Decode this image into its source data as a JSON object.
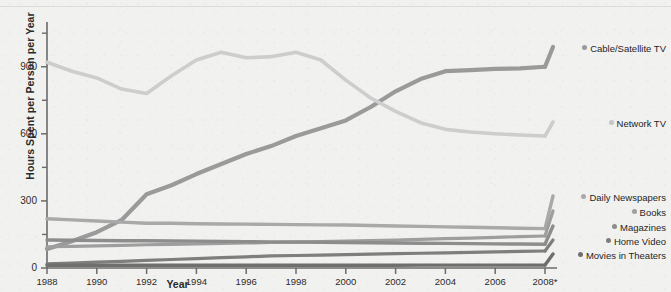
{
  "chart_data": {
    "type": "line",
    "title": "",
    "xlabel": "Year",
    "ylabel": "Hours Spent per Person per Year",
    "x": [
      1988,
      1989,
      1990,
      1991,
      1992,
      1993,
      1994,
      1995,
      1996,
      1997,
      1998,
      1999,
      2000,
      2001,
      2002,
      2003,
      2004,
      2005,
      2006,
      2007,
      2008
    ],
    "xtick_labels": [
      "1988",
      "1990",
      "1992",
      "1994",
      "1996",
      "1998",
      "2000",
      "2002",
      "2004",
      "2006",
      "2008*"
    ],
    "xtick_values": [
      1988,
      1990,
      1992,
      1994,
      1996,
      1998,
      2000,
      2002,
      2004,
      2006,
      2008
    ],
    "ytick_labels": [
      "0",
      "300",
      "600",
      "900"
    ],
    "ytick_values": [
      0,
      300,
      600,
      900
    ],
    "yminor_values": [
      150,
      450,
      750,
      1050
    ],
    "xlim": [
      1988,
      2008
    ],
    "ylim": [
      0,
      1100
    ],
    "grid": false,
    "legend_position": "right",
    "series": [
      {
        "name": "Cable/Satellite TV",
        "color": "#9a9a9a",
        "width": 4.2,
        "values": [
          85,
          120,
          160,
          215,
          330,
          370,
          420,
          465,
          510,
          545,
          590,
          625,
          660,
          720,
          790,
          845,
          880,
          885,
          890,
          893,
          900
        ]
      },
      {
        "name": "Network TV",
        "color": "#cdcdcd",
        "width": 3.6,
        "values": [
          920,
          880,
          850,
          800,
          780,
          860,
          930,
          965,
          940,
          945,
          965,
          930,
          840,
          760,
          700,
          650,
          620,
          608,
          600,
          595,
          590
        ]
      },
      {
        "name": "Daily Newspapers",
        "color": "#a9a9a9",
        "width": 3.4,
        "values": [
          220,
          215,
          210,
          205,
          200,
          200,
          198,
          197,
          196,
          195,
          194,
          193,
          192,
          190,
          188,
          186,
          184,
          182,
          180,
          178,
          176
        ]
      },
      {
        "name": "Books",
        "color": "#9e9e9e",
        "width": 3.2,
        "values": [
          95,
          97,
          99,
          101,
          104,
          106,
          108,
          110,
          112,
          114,
          116,
          118,
          120,
          122,
          125,
          128,
          131,
          134,
          137,
          140,
          143
        ]
      },
      {
        "name": "Magazines",
        "color": "#8d8d8d",
        "width": 3.4,
        "values": [
          125,
          124,
          123,
          122,
          122,
          121,
          120,
          119,
          118,
          117,
          116,
          115,
          114,
          113,
          112,
          111,
          110,
          109,
          108,
          107,
          106
        ]
      },
      {
        "name": "Home Video",
        "color": "#7e7e7e",
        "width": 3.2,
        "values": [
          18,
          22,
          26,
          30,
          34,
          38,
          42,
          46,
          50,
          54,
          56,
          58,
          60,
          62,
          64,
          66,
          68,
          70,
          72,
          74,
          76
        ]
      },
      {
        "name": "Movies in Theaters",
        "color": "#6f6f6f",
        "width": 3.4,
        "values": [
          12,
          12,
          12,
          12,
          12,
          12,
          12,
          12,
          12,
          12,
          12,
          12,
          12,
          12,
          12,
          13,
          13,
          13,
          13,
          13,
          13
        ]
      }
    ]
  },
  "legend": {
    "items": [
      {
        "label": "Cable/Satellite TV",
        "color": "#9a9a9a",
        "y": 47
      },
      {
        "label": "Network TV",
        "color": "#c5c5c5",
        "y": 122
      },
      {
        "label": "Daily Newspapers",
        "color": "#a9a9a9",
        "y": 196
      },
      {
        "label": "Books",
        "color": "#9e9e9e",
        "y": 211
      },
      {
        "label": "Magazines",
        "color": "#8d8d8d",
        "y": 226
      },
      {
        "label": "Home Video",
        "color": "#7e7e7e",
        "y": 240
      },
      {
        "label": "Movies in Theaters",
        "color": "#6f6f6f",
        "y": 254
      }
    ]
  },
  "axes": {
    "y_title": "Hours Spent per Person per Year",
    "x_title": "Year",
    "y_ticks": [
      "900",
      "600",
      "300",
      "0"
    ],
    "x_ticks": [
      "1988",
      "1990",
      "1992",
      "1994",
      "1996",
      "1998",
      "2000",
      "2002",
      "2004",
      "2006",
      "2008*"
    ],
    "axis_color": "#6b6b6b"
  }
}
